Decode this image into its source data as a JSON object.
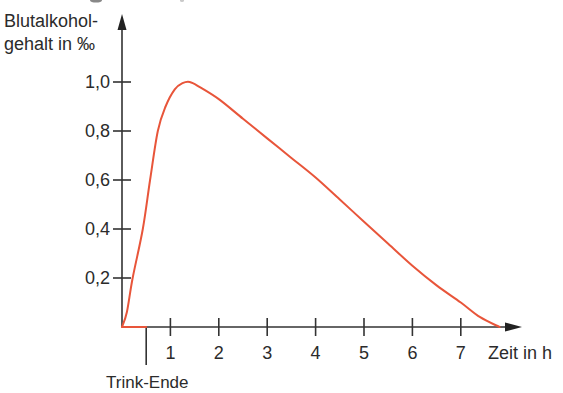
{
  "chart_data": {
    "type": "line",
    "title": "",
    "ylabel_line1": "Blutalkohol-",
    "ylabel_line2": "gehalt in ‰",
    "ylabel": "Blutalkoholgehalt in ‰",
    "xlabel": "Zeit in h",
    "xlim": [
      0,
      8
    ],
    "ylim": [
      0,
      1.1
    ],
    "grid": false,
    "legend": null,
    "x_ticks": [
      1,
      2,
      3,
      4,
      5,
      6,
      7
    ],
    "x_tick_labels": [
      "1",
      "2",
      "3",
      "4",
      "5",
      "6",
      "7"
    ],
    "y_ticks": [
      0.2,
      0.4,
      0.6,
      0.8,
      1.0
    ],
    "y_tick_labels": [
      "0,2",
      "0,4",
      "0,6",
      "0,8",
      "1,0"
    ],
    "annotations": [
      {
        "text": "Trink-Ende",
        "x": 0.5,
        "type": "vertical-marker-below-axis"
      }
    ],
    "series": [
      {
        "name": "Blutalkoholgehalt",
        "color": "#e8553a",
        "x": [
          0,
          0.1,
          0.22,
          0.43,
          0.58,
          0.74,
          0.9,
          1.09,
          1.25,
          1.4,
          1.6,
          2.0,
          2.5,
          3.0,
          3.5,
          4.0,
          4.5,
          5.0,
          5.5,
          6.0,
          6.5,
          7.0,
          7.4,
          7.8
        ],
        "values": [
          0,
          0.06,
          0.2,
          0.4,
          0.6,
          0.8,
          0.9,
          0.97,
          0.995,
          1.0,
          0.98,
          0.93,
          0.85,
          0.77,
          0.69,
          0.61,
          0.52,
          0.43,
          0.34,
          0.25,
          0.17,
          0.1,
          0.04,
          0.0
        ]
      },
      {
        "name": "Trinkphase (Achse)",
        "color": "#e8553a",
        "x": [
          0,
          0.5
        ],
        "values": [
          0,
          0
        ]
      }
    ]
  },
  "colors": {
    "curve": "#e8553a",
    "axis": "#333333",
    "text": "#2b2b2b",
    "background": "#ffffff"
  }
}
